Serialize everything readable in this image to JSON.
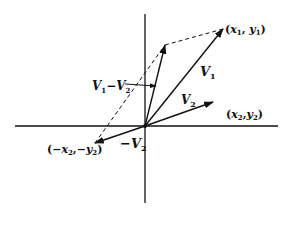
{
  "diagram": {
    "type": "vector-subtraction",
    "labels": {
      "v1": "V",
      "v1_sub": "1",
      "v2": "V",
      "v2_sub": "2",
      "neg_v2_prefix": "−",
      "neg_v2": "V",
      "neg_v2_sub": "2",
      "diff_v1": "V",
      "diff_v1_sub": "1",
      "diff_minus": "−",
      "diff_v2": "V",
      "diff_v2_sub": "2",
      "p1_open": "(",
      "p1_x": "x",
      "p1_x_sub": "1",
      "p1_comma": ", ",
      "p1_y": "y",
      "p1_y_sub": "1",
      "p1_close": ")",
      "p2_open": "(",
      "p2_x": "x",
      "p2_x_sub": "2",
      "p2_comma": ",",
      "p2_y": "y",
      "p2_y_sub": "2",
      "p2_close": ")",
      "p3_open": "(−",
      "p3_x": "x",
      "p3_x_sub": "2",
      "p3_comma": ",−",
      "p3_y": "y",
      "p3_y_sub": "2",
      "p3_close": ")"
    },
    "points": {
      "origin": [
        145,
        126
      ],
      "v1_tip": [
        223,
        29
      ],
      "v2_tip": [
        213,
        102
      ],
      "neg_v2_tip": [
        95,
        143
      ],
      "diff_tip": [
        165,
        45
      ]
    },
    "line_color": "#111111"
  }
}
